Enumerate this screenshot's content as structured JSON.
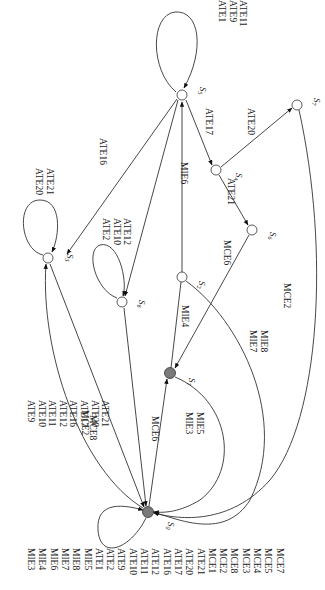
{
  "diagram": {
    "type": "state-transition-diagram",
    "orientation": "rotated-90",
    "colors": {
      "active_node": "#7a7a7a",
      "node": "#ffffff",
      "edge": "#333333"
    },
    "nodes": {
      "s0": {
        "label": "S",
        "sub": "0",
        "filled": true
      },
      "s1": {
        "label": "S",
        "sub": "1",
        "filled": true
      },
      "s2": {
        "label": "S",
        "sub": "2",
        "filled": false
      },
      "s3": {
        "label": "S",
        "sub": "3",
        "filled": false
      },
      "s4": {
        "label": "S",
        "sub": "4",
        "filled": false
      },
      "s5": {
        "label": "S",
        "sub": "5",
        "filled": false
      },
      "s6": {
        "label": "S",
        "sub": "6",
        "filled": false
      },
      "s7": {
        "label": "S",
        "sub": "7",
        "filled": false
      },
      "s8": {
        "label": "S",
        "sub": "8",
        "filled": false
      }
    },
    "edge_labels": {
      "s0_loop": [
        "MIE3",
        "MIE4",
        "MIE6",
        "MIE7",
        "MIE8",
        "MIE5",
        "ATE1",
        "ATE2",
        "ATE9",
        "ATE10",
        "ATE11",
        "ATE12",
        "ATE16",
        "ATE17",
        "ATE20",
        "ATE21",
        "MCE1",
        "MCE2",
        "MCE8",
        "MCE3",
        "MCE4",
        "MCE5",
        "MCE7"
      ],
      "s3_to_s0": [
        "ATE9",
        "ATE10",
        "ATE11",
        "ATE12",
        "ATE16",
        "ATE17",
        "ATE20",
        "ATE21"
      ],
      "s3_loop": [
        "ATE20",
        "ATE21"
      ],
      "s5_to_s3": [
        "ATE16"
      ],
      "s8_loop": [
        "ATE2",
        "ATE10",
        "ATE12"
      ],
      "s8_to_s0": [
        "MCE8"
      ],
      "s0_to_s3": [
        "MCE2"
      ],
      "s0_to_s1": [
        "MCE6"
      ],
      "s1_to_s0": [
        "MIE3",
        "MIE5"
      ],
      "s1_to_s2": [
        "MIE4"
      ],
      "s2_to_s5": [
        "MIE6"
      ],
      "s2_to_s0": [
        "MIE7",
        "MIE8"
      ],
      "s6_to_s1": [
        "MCE6"
      ],
      "s5_loop": [
        "ATE1",
        "ATE9",
        "ATE11"
      ],
      "s5_to_s4": [
        "ATE17"
      ],
      "s4_to_s6": [
        "ATE21"
      ],
      "s4_to_s7": [
        "ATE20"
      ],
      "s7_to_s0": [
        "MCE2"
      ]
    }
  }
}
